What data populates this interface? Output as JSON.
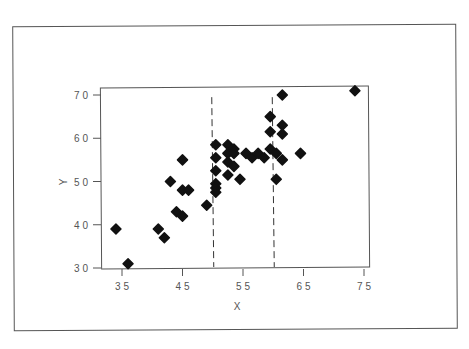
{
  "chart_data": {
    "type": "scatter",
    "title": "",
    "xlabel": "X",
    "ylabel": "Y",
    "xlim": [
      32.5,
      76
    ],
    "ylim": [
      29,
      72.5
    ],
    "xticks": [
      35,
      45,
      55,
      65,
      75
    ],
    "yticks": [
      30,
      40,
      50,
      60,
      70
    ],
    "grid": false,
    "legend": null,
    "marker": "diamond",
    "marker_color": "#111111",
    "reference_lines": [
      {
        "orientation": "vertical",
        "x": 50,
        "style": "dashed"
      },
      {
        "orientation": "vertical",
        "x": 60,
        "style": "dashed"
      }
    ],
    "series": [
      {
        "name": "data",
        "points": [
          [
            34,
            39
          ],
          [
            36,
            31
          ],
          [
            41,
            39
          ],
          [
            42,
            37
          ],
          [
            43,
            50
          ],
          [
            45,
            55
          ],
          [
            45,
            48
          ],
          [
            46,
            48
          ],
          [
            44,
            43
          ],
          [
            45,
            42
          ],
          [
            49,
            44.5
          ],
          [
            50.5,
            58.5
          ],
          [
            50.5,
            55.5
          ],
          [
            50.5,
            52.5
          ],
          [
            50.5,
            49.5
          ],
          [
            50.5,
            48.5
          ],
          [
            50.5,
            47.5
          ],
          [
            52.5,
            58.5
          ],
          [
            52.5,
            56.5
          ],
          [
            53.5,
            57.5
          ],
          [
            53.5,
            56.5
          ],
          [
            52.5,
            54.5
          ],
          [
            53.5,
            53.5
          ],
          [
            52.5,
            51.5
          ],
          [
            54.5,
            50.5
          ],
          [
            55.5,
            56.5
          ],
          [
            56.5,
            55.5
          ],
          [
            57.5,
            56.5
          ],
          [
            58.5,
            55.5
          ],
          [
            59.5,
            65
          ],
          [
            59.5,
            61.5
          ],
          [
            59.5,
            57.5
          ],
          [
            60.5,
            56.5
          ],
          [
            61.5,
            70
          ],
          [
            61.5,
            63
          ],
          [
            61.5,
            61
          ],
          [
            61.5,
            55
          ],
          [
            60.5,
            50.5
          ],
          [
            64.5,
            56.5
          ],
          [
            73.5,
            71
          ]
        ]
      }
    ]
  }
}
